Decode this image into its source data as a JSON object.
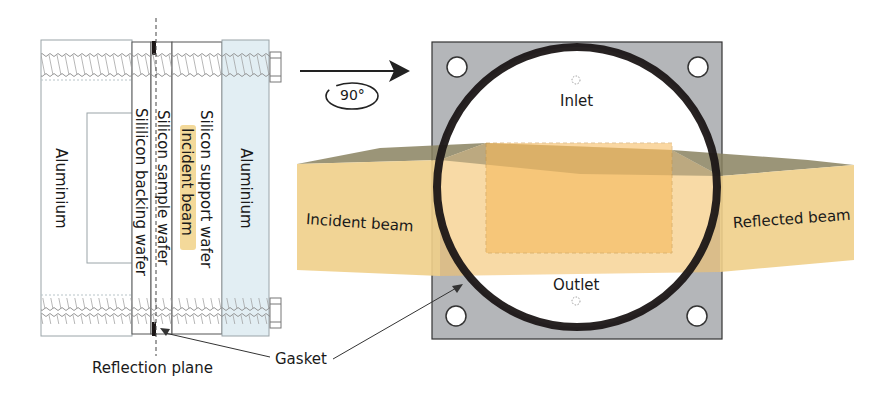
{
  "side_view": {
    "labels": {
      "aluminium_left": "Aluminium",
      "silicon_backing": "Sililicon backing wafer",
      "silicon_sample": "Silicon sample wafer",
      "incident_beam": "Incident beam",
      "silicon_support": "Silicon support wafer",
      "aluminium_right": "Aluminium"
    },
    "reflection_plane": "Reflection plane"
  },
  "rotation": {
    "label": "90°"
  },
  "front_view": {
    "inlet": "Inlet",
    "outlet": "Outlet",
    "incident_beam": "Incident beam",
    "reflected_beam": "Reflected beam"
  },
  "gasket_label": "Gasket",
  "colors": {
    "plate": "#b4b6b9",
    "gasket": "#1b1616",
    "beam": "#f0c878",
    "beam_top": "#8a8260",
    "aluminium_right": "#e2eef3",
    "highlight": "#f3d99a"
  }
}
